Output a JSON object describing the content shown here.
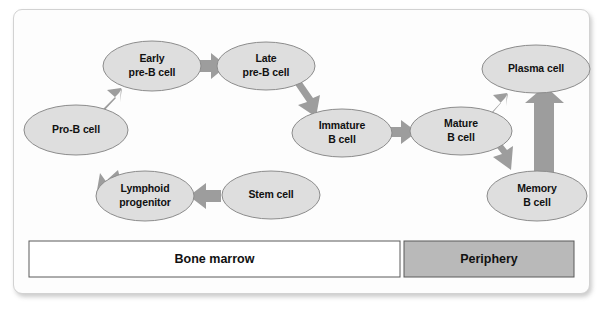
{
  "figure": {
    "background_color": "#ffffff",
    "card_color": "#fdfdfd",
    "node_fill_color": "#dedede",
    "node_stroke_color": "#8c8c8c",
    "arrow_color": "#9d9d9d",
    "label_color": "#111111"
  },
  "nodes": [
    {
      "id": "pro-b-cell",
      "line1": "Pro-B cell",
      "line2": "",
      "cx": 76,
      "cy": 130,
      "rx": 52,
      "ry": 25
    },
    {
      "id": "early-pre-b-cell",
      "line1": "Early",
      "line2": "pre-B cell",
      "cx": 152,
      "cy": 66,
      "rx": 49,
      "ry": 25
    },
    {
      "id": "late-pre-b-cell",
      "line1": "Late",
      "line2": "pre-B cell",
      "cx": 266,
      "cy": 66,
      "rx": 49,
      "ry": 24
    },
    {
      "id": "immature-b-cell",
      "line1": "Immature",
      "line2": "B cell",
      "cx": 342,
      "cy": 133,
      "rx": 50,
      "ry": 24
    },
    {
      "id": "mature-b-cell",
      "line1": "Mature",
      "line2": "B cell",
      "cx": 461,
      "cy": 131,
      "rx": 51,
      "ry": 24
    },
    {
      "id": "plasma-cell",
      "line1": "Plasma cell",
      "line2": "",
      "cx": 536,
      "cy": 69,
      "rx": 54,
      "ry": 24
    },
    {
      "id": "memory-b-cell",
      "line1": "Memory",
      "line2": "B cell",
      "cx": 537,
      "cy": 196,
      "rx": 50,
      "ry": 25
    },
    {
      "id": "stem-cell",
      "line1": "Stem cell",
      "line2": "",
      "cx": 271,
      "cy": 195,
      "rx": 49,
      "ry": 24
    },
    {
      "id": "lymphoid-progenitor",
      "line1": "Lymphoid",
      "line2": "progenitor",
      "cx": 145,
      "cy": 196,
      "rx": 49,
      "ry": 25
    }
  ],
  "edges": [
    {
      "id": "stem-to-lymphoid",
      "from": "stem-cell",
      "to": "lymphoid-progenitor"
    },
    {
      "id": "lymphoid-to-pro-b",
      "from": "lymphoid-progenitor",
      "to": "pro-b-cell"
    },
    {
      "id": "pro-b-to-early-pre-b",
      "from": "pro-b-cell",
      "to": "early-pre-b-cell"
    },
    {
      "id": "early-to-late-pre-b",
      "from": "early-pre-b-cell",
      "to": "late-pre-b-cell"
    },
    {
      "id": "late-pre-b-to-immature",
      "from": "late-pre-b-cell",
      "to": "immature-b-cell"
    },
    {
      "id": "immature-to-mature",
      "from": "immature-b-cell",
      "to": "mature-b-cell"
    },
    {
      "id": "mature-to-plasma",
      "from": "mature-b-cell",
      "to": "plasma-cell"
    },
    {
      "id": "mature-to-memory",
      "from": "mature-b-cell",
      "to": "memory-b-cell"
    },
    {
      "id": "memory-to-plasma",
      "from": "memory-b-cell",
      "to": "plasma-cell"
    }
  ],
  "compartments": [
    {
      "id": "bone-marrow",
      "label": "Bone marrow",
      "fill": "#ffffff",
      "x": 29,
      "y": 241,
      "w": 371,
      "h": 36
    },
    {
      "id": "periphery",
      "label": "Periphery",
      "fill": "#b9b9b9",
      "x": 404,
      "y": 241,
      "w": 170,
      "h": 36
    }
  ]
}
